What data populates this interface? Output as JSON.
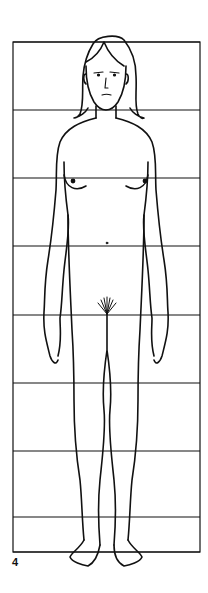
{
  "figure": {
    "label": "4",
    "line_color": "#111111",
    "background": "#ffffff"
  },
  "grid": {
    "left": 13,
    "right": 200,
    "top": 42,
    "bottom": 552,
    "horizontal_lines_y": [
      42,
      110,
      178,
      246,
      315,
      383,
      451,
      517,
      552
    ],
    "units": 7.5
  }
}
